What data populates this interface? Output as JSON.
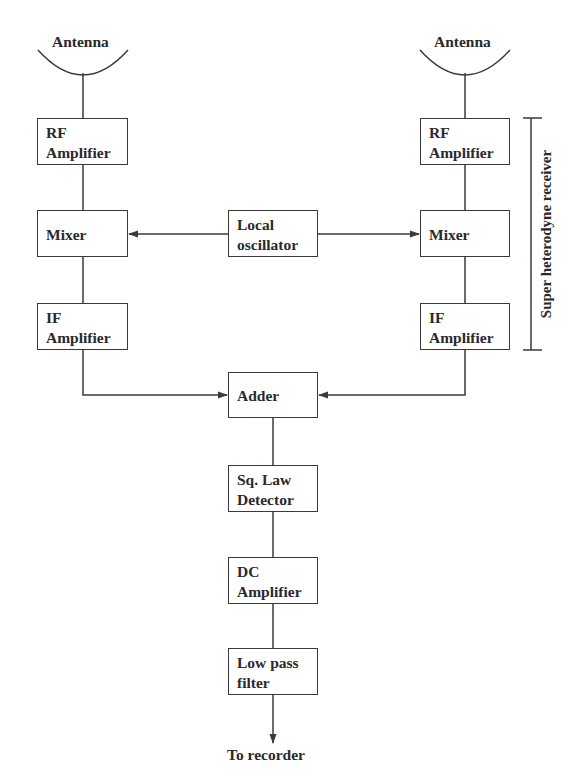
{
  "diagram": {
    "type": "block-diagram",
    "left_chain": {
      "antenna": "Antenna",
      "rf_amplifier": [
        "RF",
        "Amplifier"
      ],
      "mixer": "Mixer",
      "if_amplifier": [
        "IF",
        "Amplifier"
      ]
    },
    "right_chain": {
      "antenna": "Antenna",
      "rf_amplifier": [
        "RF",
        "Amplifier"
      ],
      "mixer": "Mixer",
      "if_amplifier": [
        "IF",
        "Amplifier"
      ]
    },
    "local_oscillator": [
      "Local",
      "oscillator"
    ],
    "adder": "Adder",
    "detector": [
      "Sq. Law",
      "Detector"
    ],
    "dc_amplifier": [
      "DC",
      "Amplifier"
    ],
    "low_pass_filter": [
      "Low pass",
      "filter"
    ],
    "output": "To recorder",
    "bracket_label": "Super heterodyne receiver",
    "connections": [
      {
        "from": "left_antenna",
        "to": "left_rf_amplifier",
        "arrow": false
      },
      {
        "from": "left_rf_amplifier",
        "to": "left_mixer",
        "arrow": false
      },
      {
        "from": "local_oscillator",
        "to": "left_mixer",
        "arrow": true
      },
      {
        "from": "local_oscillator",
        "to": "right_mixer",
        "arrow": true
      },
      {
        "from": "left_mixer",
        "to": "left_if_amplifier",
        "arrow": false
      },
      {
        "from": "right_antenna",
        "to": "right_rf_amplifier",
        "arrow": false
      },
      {
        "from": "right_rf_amplifier",
        "to": "right_mixer",
        "arrow": false
      },
      {
        "from": "right_mixer",
        "to": "right_if_amplifier",
        "arrow": false
      },
      {
        "from": "left_if_amplifier",
        "to": "adder",
        "arrow": true
      },
      {
        "from": "right_if_amplifier",
        "to": "adder",
        "arrow": true
      },
      {
        "from": "adder",
        "to": "detector",
        "arrow": false
      },
      {
        "from": "detector",
        "to": "dc_amplifier",
        "arrow": false
      },
      {
        "from": "dc_amplifier",
        "to": "low_pass_filter",
        "arrow": false
      },
      {
        "from": "low_pass_filter",
        "to": "output",
        "arrow": true
      }
    ]
  },
  "colors": {
    "line": "#3a3a3a",
    "text": "#2a2a2a",
    "background": "#ffffff"
  }
}
